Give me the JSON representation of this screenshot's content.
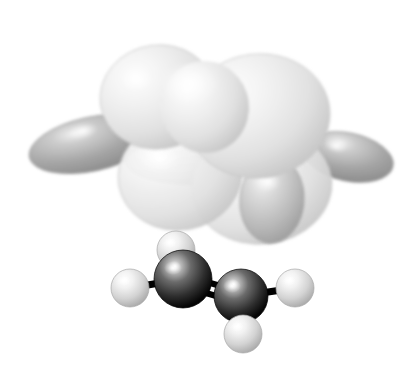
{
  "figure": {
    "kind": "molecular-orbital-isosurface",
    "molecule_name": "ethylene",
    "molecule_formula": "C2H4",
    "orbital_label": "pi orbital isosurface",
    "render_style": "ball-and-stick with translucent dithered isosurface",
    "background_color": "#ffffff",
    "width": 409,
    "height": 377,
    "caption": "Ethylene (C2H4) shown as a ball-and-stick model beneath a grey dithered pi-type molecular orbital isosurface."
  },
  "palette": {
    "surface_light": "#eeeeee",
    "surface_light_edge": "#c9c9c9",
    "surface_mid": "#bdbdbd",
    "surface_mid_edge": "#9a9a9a",
    "surface_dark": "#9d9d9d",
    "surface_dark_edge": "#7c7c7c",
    "highlight": "#ffffff",
    "carbon_color": "#3a3a3a",
    "carbon_edge": "#0a0a0a",
    "hydrogen_color": "#d8d8d8",
    "hydrogen_edge": "#a8a8a8",
    "bond_color": "#000000"
  },
  "atoms": [
    {
      "id": "C1",
      "element": "C",
      "label": "carbon",
      "cx": 183,
      "cy": 279,
      "r": 29
    },
    {
      "id": "C2",
      "element": "C",
      "label": "carbon",
      "cx": 241,
      "cy": 296,
      "r": 27
    },
    {
      "id": "H1",
      "element": "H",
      "label": "hydrogen",
      "cx": 130,
      "cy": 288,
      "r": 19
    },
    {
      "id": "H2",
      "element": "H",
      "label": "hydrogen",
      "cx": 176,
      "cy": 250,
      "r": 19
    },
    {
      "id": "H3",
      "element": "H",
      "label": "hydrogen",
      "cx": 295,
      "cy": 288,
      "r": 19
    },
    {
      "id": "H4",
      "element": "H",
      "label": "hydrogen",
      "cx": 243,
      "cy": 334,
      "r": 19
    }
  ],
  "bonds": [
    {
      "id": "C1-C2",
      "type": "double",
      "from": "C1",
      "to": "C2",
      "x1": 183,
      "y1": 279,
      "x2": 241,
      "y2": 296,
      "width": 7
    },
    {
      "id": "C1-H1",
      "type": "single",
      "from": "C1",
      "to": "H1",
      "x1": 183,
      "y1": 279,
      "x2": 130,
      "y2": 288,
      "width": 7
    },
    {
      "id": "C1-H2",
      "type": "single",
      "from": "C1",
      "to": "H2",
      "x1": 183,
      "y1": 279,
      "x2": 176,
      "y2": 250,
      "width": 7
    },
    {
      "id": "C2-H3",
      "type": "single",
      "from": "C2",
      "to": "H3",
      "x1": 241,
      "y1": 296,
      "x2": 295,
      "y2": 288,
      "width": 7
    },
    {
      "id": "C2-H4",
      "type": "single",
      "from": "C2",
      "to": "H4",
      "x1": 241,
      "y1": 296,
      "x2": 243,
      "y2": 334,
      "width": 7
    }
  ],
  "lobes": [
    {
      "id": "lobe-upper-left",
      "label": "upper-left light lobe",
      "shade": "light",
      "cx": 158,
      "cy": 97,
      "rx": 58,
      "ry": 52,
      "rotate": -8,
      "highlight_x": 138,
      "highlight_y": 80
    },
    {
      "id": "lobe-upper-right",
      "label": "upper-right light lobe",
      "shade": "light",
      "cx": 258,
      "cy": 116,
      "rx": 72,
      "ry": 62,
      "rotate": -6,
      "highlight_x": 236,
      "highlight_y": 92
    },
    {
      "id": "lobe-lower-front",
      "label": "lower front light lobe",
      "shade": "light",
      "cx": 180,
      "cy": 175,
      "rx": 62,
      "ry": 55,
      "rotate": -10,
      "highlight_x": 160,
      "highlight_y": 158
    },
    {
      "id": "lobe-lower-right",
      "label": "lower right light lobe",
      "shade": "light",
      "cx": 262,
      "cy": 186,
      "rx": 70,
      "ry": 58,
      "rotate": -6,
      "highlight_x": 240,
      "highlight_y": 168
    },
    {
      "id": "lobe-back-left",
      "label": "left dark lobe",
      "shade": "dark",
      "cx": 92,
      "cy": 144,
      "rx": 64,
      "ry": 27,
      "rotate": -12,
      "highlight_x": 83,
      "highlight_y": 131
    },
    {
      "id": "lobe-back-mid",
      "label": "middle dark band lobe",
      "shade": "mid",
      "cx": 208,
      "cy": 160,
      "rx": 82,
      "ry": 25,
      "rotate": -2,
      "highlight_x": 176,
      "highlight_y": 150
    },
    {
      "id": "lobe-back-right",
      "label": "right dark lobe",
      "shade": "dark",
      "cx": 348,
      "cy": 157,
      "rx": 46,
      "ry": 24,
      "rotate": 12,
      "highlight_x": 336,
      "highlight_y": 146
    },
    {
      "id": "lobe-front-egg",
      "label": "front mid-grey egg lobe",
      "shade": "mid",
      "cx": 272,
      "cy": 200,
      "rx": 32,
      "ry": 43,
      "rotate": 4,
      "highlight_x": 268,
      "highlight_y": 182
    }
  ]
}
